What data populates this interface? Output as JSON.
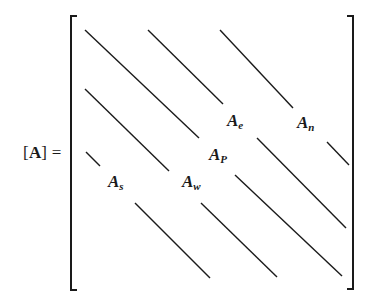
{
  "equation": {
    "lhs_open": "[",
    "lhs_symbol": "A",
    "lhs_close": "]",
    "equals": " ="
  },
  "coefficients": [
    {
      "id": "A_e",
      "base": "A",
      "sub": "e",
      "x": 227,
      "y": 112
    },
    {
      "id": "A_n",
      "base": "A",
      "sub": "n",
      "x": 297,
      "y": 114
    },
    {
      "id": "A_P",
      "base": "A",
      "sub": "P",
      "x": 209,
      "y": 146
    },
    {
      "id": "A_s",
      "base": "A",
      "sub": "s",
      "x": 108,
      "y": 173
    },
    {
      "id": "A_w",
      "base": "A",
      "sub": "w",
      "x": 182,
      "y": 173
    }
  ],
  "diagonals": [
    {
      "name": "diagonal-main-upper",
      "x1": 85,
      "y1": 30,
      "x2": 199,
      "y2": 138
    },
    {
      "name": "diagonal-e-upper",
      "x1": 148,
      "y1": 30,
      "x2": 223,
      "y2": 104
    },
    {
      "name": "diagonal-n-upper",
      "x1": 220,
      "y1": 30,
      "x2": 293,
      "y2": 108
    },
    {
      "name": "diagonal-w-upper",
      "x1": 85,
      "y1": 89,
      "x2": 169,
      "y2": 171
    },
    {
      "name": "diagonal-s-upper",
      "x1": 86,
      "y1": 152,
      "x2": 100,
      "y2": 166
    },
    {
      "name": "diagonal-n-lower",
      "x1": 327,
      "y1": 142,
      "x2": 349,
      "y2": 165
    },
    {
      "name": "diagonal-e-lower",
      "x1": 257,
      "y1": 138,
      "x2": 346,
      "y2": 228
    },
    {
      "name": "diagonal-main-lower",
      "x1": 235,
      "y1": 175,
      "x2": 342,
      "y2": 276
    },
    {
      "name": "diagonal-w-lower",
      "x1": 201,
      "y1": 203,
      "x2": 277,
      "y2": 277
    },
    {
      "name": "diagonal-s-lower",
      "x1": 135,
      "y1": 203,
      "x2": 210,
      "y2": 278
    }
  ],
  "brackets": {
    "left": {
      "x": 71,
      "top": 16,
      "bottom": 290,
      "serif": 6
    },
    "right": {
      "x": 353,
      "top": 16,
      "bottom": 289,
      "serif": 6
    }
  },
  "colors": {
    "ink": "#1a1a1a",
    "background": "#ffffff"
  }
}
